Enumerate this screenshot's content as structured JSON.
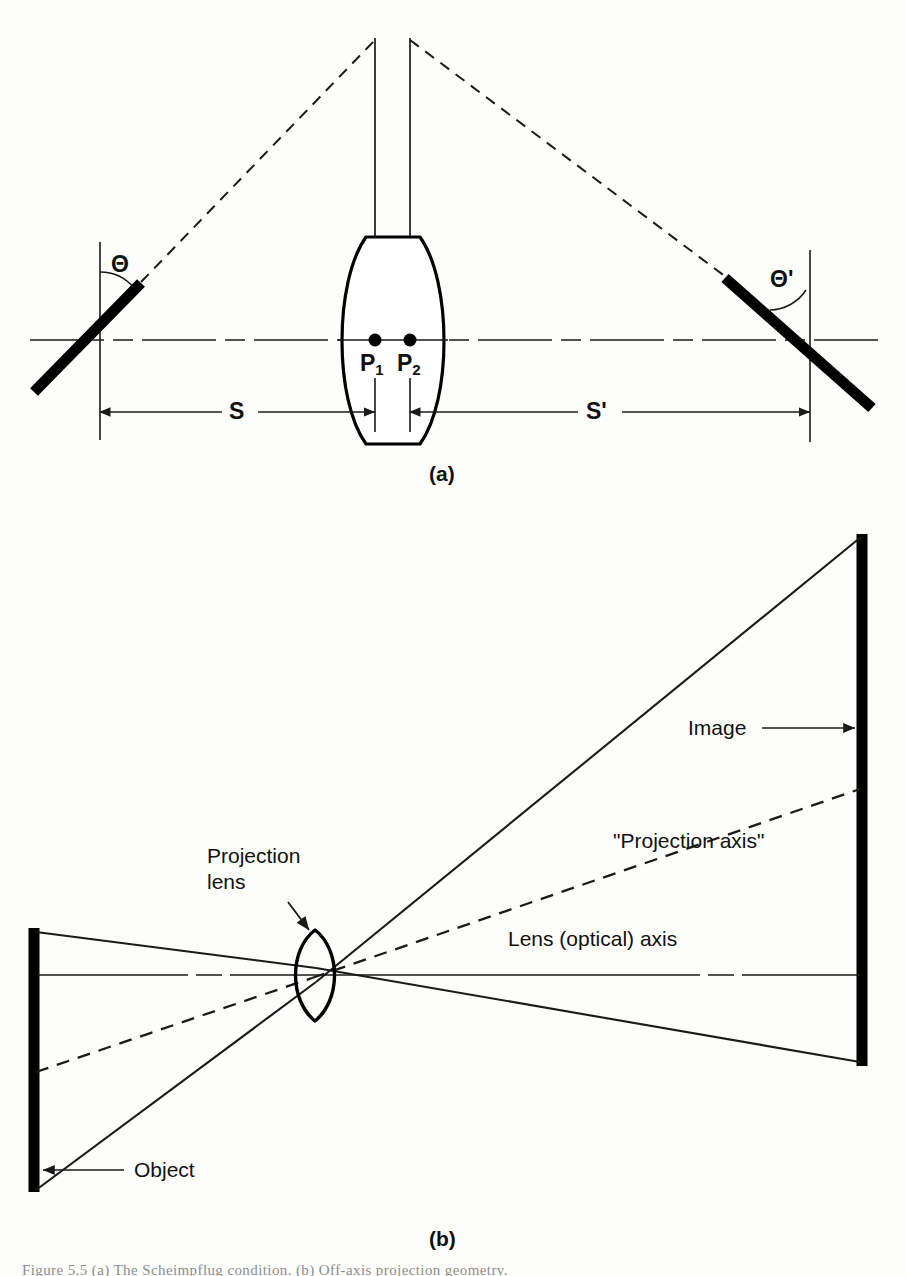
{
  "figure": {
    "panels": [
      {
        "id": "a",
        "caption": "(a)",
        "description": "Tilted object and image planes with lens principal points"
      },
      {
        "id": "b",
        "caption": "(b)",
        "description": "Projection lens forming an enlarged image, showing the lens optical axis and the tilted projection axis"
      }
    ]
  },
  "panel_a": {
    "caption": "(a)",
    "angle_object_label": "Θ",
    "angle_image_label": "Θ'",
    "principal_point_1": "P",
    "principal_point_1_sub": "1",
    "principal_point_2": "P",
    "principal_point_2_sub": "2",
    "object_distance_label": "S",
    "image_distance_label": "S'",
    "elements": {
      "object_plane": "tilted black bar, left",
      "image_plane": "tilted black bar, right",
      "lens": "thick biconvex lens at centre",
      "optical_axis": "horizontal dash-dot line",
      "principal_planes": "two vertical lines through P1 and P2",
      "chief_rays": "dashed rays from object plane to image plane"
    }
  },
  "panel_b": {
    "caption": "(b)",
    "labels": {
      "object": "Object",
      "image": "Image",
      "projection_lens": "Projection\nlens",
      "projection_lens_line1": "Projection",
      "projection_lens_line2": "lens",
      "projection_axis": "\"Projection axis\"",
      "lens_optical_axis": "Lens (optical) axis"
    },
    "elements": {
      "object_bar": "vertical black bar at left",
      "image_bar": "vertical black bar at right",
      "lens": "small pointed biconvex projection lens",
      "marginal_rays": "solid rays from object extremes through the lens to image extremes",
      "projection_axis_ray": "dashed tilted axis line",
      "optical_axis": "horizontal dash-dot line"
    }
  },
  "bottom_caption": {
    "text": "Figure 5.5   (a) The Scheimpflug condition. (b) Off-axis projection geometry."
  },
  "colors": {
    "ink": "#000000",
    "paper": "#fdfdfb",
    "line": "#1a1a1a",
    "faint": "#8d8d8d"
  }
}
